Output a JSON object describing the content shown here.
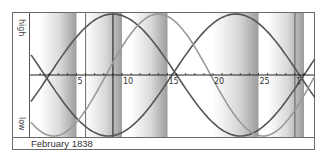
{
  "chart_data": {
    "type": "line",
    "title": "",
    "caption": "February 1838",
    "xlabel": "Day of month",
    "ylabel_top": "high",
    "ylabel_bottom": "low",
    "x_ticks": [
      {
        "day": 5,
        "label": "5"
      },
      {
        "day": 10,
        "label": "10"
      },
      {
        "day": 15,
        "label": "15"
      },
      {
        "day": 20,
        "label": "20"
      },
      {
        "day": 25,
        "label": "25"
      },
      {
        "day": 29,
        "label": "1"
      }
    ],
    "x_range": [
      0,
      31
    ],
    "y_range": [
      -1,
      1
    ],
    "grid": false,
    "vertical_markers": [
      6,
      9,
      29
    ],
    "shaded_bands": [
      {
        "start": 1,
        "end": 5
      },
      {
        "start": 6,
        "end": 10
      },
      {
        "start": 11,
        "end": 15
      },
      {
        "start": 20,
        "end": 25
      },
      {
        "start": 26,
        "end": 30
      }
    ],
    "series": [
      {
        "name": "curve A (dark)",
        "color": "#555555",
        "period_days": 28,
        "peak_day": 9
      },
      {
        "name": "curve B (dark)",
        "color": "#555555",
        "period_days": 28,
        "peak_day": 22.5
      },
      {
        "name": "curve C (light)",
        "color": "#9a9a9a",
        "period_days": 23,
        "peak_day": 14
      }
    ]
  },
  "labels": {
    "high": "high",
    "low": "low",
    "footer": "February 1838"
  }
}
